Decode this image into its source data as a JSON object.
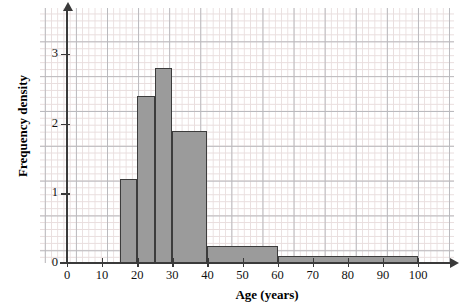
{
  "chart_data": {
    "type": "bar",
    "title": "",
    "subtitle": "",
    "xlabel": "Age (years)",
    "ylabel": "Frequency density",
    "xlim": [
      0,
      100
    ],
    "ylim": [
      0,
      3.3
    ],
    "xticks": [
      0,
      10,
      20,
      30,
      40,
      50,
      60,
      70,
      80,
      90,
      100
    ],
    "yticks": [
      0,
      1,
      2,
      3
    ],
    "grid": true,
    "grid_minor_x": 2,
    "grid_minor_y": 0.1,
    "grid_major_x": 10,
    "grid_major_y": 0.5,
    "legend": "none",
    "bar_fill_color": "#9b9b9b",
    "bar_edge_color": "#3c3c3c",
    "bins": [
      {
        "label": "15-20",
        "x0": 15,
        "x1": 20,
        "value": 1.2
      },
      {
        "label": "20-25",
        "x0": 20,
        "x1": 25,
        "value": 2.4
      },
      {
        "label": "25-30",
        "x0": 25,
        "x1": 30,
        "value": 2.8
      },
      {
        "label": "30-40",
        "x0": 30,
        "x1": 40,
        "value": 1.9
      },
      {
        "label": "40-60",
        "x0": 40,
        "x1": 60,
        "value": 0.25
      },
      {
        "label": "60-100",
        "x0": 60,
        "x1": 100,
        "value": 0.1
      }
    ],
    "categories": [
      "15-20",
      "20-25",
      "25-30",
      "30-40",
      "40-60",
      "60-100"
    ],
    "values": [
      1.2,
      2.4,
      2.8,
      1.9,
      0.25,
      0.1
    ]
  }
}
